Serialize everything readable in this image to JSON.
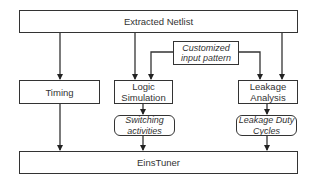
{
  "diagram": {
    "nodes": {
      "netlist": {
        "label": "Extracted Netlist"
      },
      "input_pattern": {
        "label_line1": "Customized",
        "label_line2": "input pattern"
      },
      "timing": {
        "label": "Timing"
      },
      "logic_sim": {
        "label_line1": "Logic",
        "label_line2": "Simulation"
      },
      "leakage": {
        "label_line1": "Leakage",
        "label_line2": "Analysis"
      },
      "switching": {
        "label_line1": "Switching",
        "label_line2": "activities"
      },
      "duty_cycles": {
        "label_line1": "Leakage Duty",
        "label_line2": "Cycles"
      },
      "einstuner": {
        "label": "EinsTuner"
      }
    },
    "edges": [
      {
        "from": "Extracted Netlist",
        "to": "Timing"
      },
      {
        "from": "Extracted Netlist",
        "to": "Logic Simulation"
      },
      {
        "from": "Extracted Netlist",
        "to": "Leakage Analysis"
      },
      {
        "from": "Customized input pattern",
        "to": "Logic Simulation"
      },
      {
        "from": "Customized input pattern",
        "to": "Leakage Analysis"
      },
      {
        "from": "Timing",
        "to": "EinsTuner"
      },
      {
        "from": "Logic Simulation",
        "to": "Switching activities"
      },
      {
        "from": "Switching activities",
        "to": "EinsTuner"
      },
      {
        "from": "Leakage Analysis",
        "to": "Leakage Duty Cycles"
      },
      {
        "from": "Leakage Duty Cycles",
        "to": "EinsTuner"
      }
    ],
    "colors": {
      "line": "#333333",
      "background": "#ffffff"
    }
  }
}
